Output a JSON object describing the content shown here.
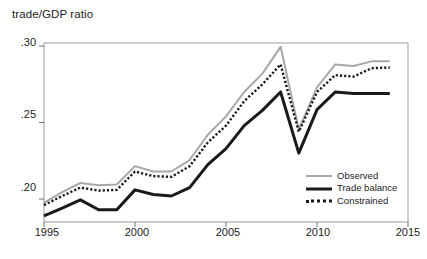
{
  "chart_data": {
    "type": "line",
    "title": "trade/GDP ratio",
    "xlabel": "",
    "ylabel": "",
    "xlim": [
      1995,
      2015
    ],
    "ylim": [
      0.185,
      0.302
    ],
    "grid": false,
    "legend_position": "bottom-right",
    "x": [
      1995,
      1996,
      1997,
      1998,
      1999,
      2000,
      2001,
      2002,
      2003,
      2004,
      2005,
      2006,
      2007,
      2008,
      2009,
      2010,
      2011,
      2012,
      2013,
      2014
    ],
    "xticks": [
      1995,
      2000,
      2005,
      2010,
      2015
    ],
    "xticklabels": [
      "1995",
      "2000",
      "2005",
      "2010",
      "2015"
    ],
    "yticks": [
      0.2,
      0.25,
      0.3
    ],
    "yticklabels": [
      ".20",
      ".25",
      ".30"
    ],
    "series": [
      {
        "name": "Observed",
        "color": "#a8a8a8",
        "style": "solid",
        "width": 2,
        "values": [
          0.1975,
          0.2045,
          0.2105,
          0.209,
          0.2095,
          0.2215,
          0.218,
          0.218,
          0.2255,
          0.242,
          0.254,
          0.27,
          0.282,
          0.2995,
          0.2455,
          0.273,
          0.288,
          0.287,
          0.29,
          0.29
        ]
      },
      {
        "name": "Trade balance",
        "color": "#1a1a1a",
        "style": "solid",
        "width": 3,
        "values": [
          0.189,
          0.194,
          0.1995,
          0.193,
          0.193,
          0.206,
          0.203,
          0.202,
          0.2075,
          0.2225,
          0.233,
          0.248,
          0.258,
          0.27,
          0.23,
          0.2585,
          0.27,
          0.269,
          0.269,
          0.269
        ]
      },
      {
        "name": "Constrained",
        "color": "#1a1a1a",
        "style": "dotted",
        "width": 2.4,
        "values": [
          0.196,
          0.202,
          0.2075,
          0.2055,
          0.206,
          0.218,
          0.215,
          0.2145,
          0.2215,
          0.237,
          0.248,
          0.264,
          0.275,
          0.288,
          0.244,
          0.27,
          0.281,
          0.28,
          0.2855,
          0.286
        ]
      }
    ]
  },
  "legend": {
    "items": [
      {
        "label": "Observed"
      },
      {
        "label": "Trade balance"
      },
      {
        "label": "Constrained"
      }
    ]
  },
  "axes": {
    "y_tick_labels": [
      ".30",
      ".25",
      ".20"
    ],
    "x_tick_labels": [
      "1995",
      "2000",
      "2005",
      "2010",
      "2015"
    ]
  }
}
